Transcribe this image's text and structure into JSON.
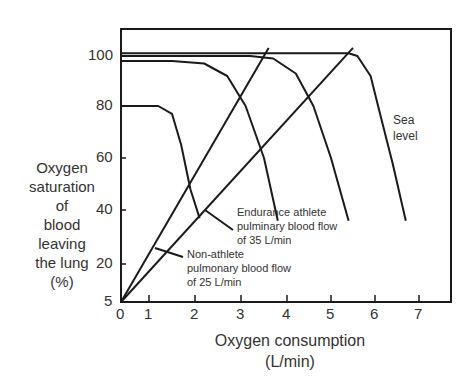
{
  "chart_data": {
    "type": "line",
    "title": "",
    "xlabel": "Oxygen consumption (L/min)",
    "xlabel_lines": [
      "Oxygen consumption",
      "(L/min)"
    ],
    "ylabel": "Oxygen saturation of blood leaving the lung (%)",
    "ylabel_lines": [
      "Oxygen",
      "saturation",
      "of",
      "blood",
      "leaving",
      "the lung",
      "(%)"
    ],
    "x_ticks": [
      "0",
      "1",
      "2",
      "3",
      "4",
      "5",
      "6",
      "7"
    ],
    "y_ticks": [
      "5",
      "20",
      "40",
      "60",
      "80",
      "100"
    ],
    "xlim": [
      0,
      7.7
    ],
    "ylim": [
      5,
      110
    ],
    "grid": false,
    "legend": "none",
    "series": [
      {
        "name": "Non-athlete pulmonary blood flow of 25 L/min",
        "kind": "straight",
        "x": [
          0,
          3.6
        ],
        "y": [
          5,
          103
        ]
      },
      {
        "name": "Endurance athlete pulmonary blood flow of 35 L/min",
        "kind": "straight",
        "x": [
          0,
          5.5
        ],
        "y": [
          5,
          103
        ]
      },
      {
        "name": "Altitude curve (80%)",
        "kind": "saturation",
        "x": [
          0,
          1.2,
          1.5,
          1.7,
          1.9,
          2.1
        ],
        "y": [
          80,
          80,
          77,
          65,
          48,
          37
        ]
      },
      {
        "name": "Curve (~98%)",
        "kind": "saturation",
        "x": [
          0,
          1.5,
          2.2,
          2.7,
          3.1,
          3.5,
          3.8
        ],
        "y": [
          98,
          98,
          97,
          92,
          80,
          60,
          36
        ]
      },
      {
        "name": "Curve (~100%)",
        "kind": "saturation",
        "x": [
          0,
          3.2,
          3.7,
          4.2,
          4.6,
          5.0,
          5.4
        ],
        "y": [
          100,
          100,
          99,
          93,
          80,
          60,
          36
        ]
      },
      {
        "name": "Sea level",
        "kind": "saturation",
        "x": [
          0,
          5.4,
          5.6,
          5.9,
          6.1,
          6.4,
          6.7
        ],
        "y": [
          101,
          101,
          100,
          92,
          78,
          58,
          36
        ]
      }
    ],
    "annotations": [
      {
        "text": "Sea level",
        "lines": [
          "Sea",
          "level"
        ]
      },
      {
        "text": "Endurance athlete pulmonary blood flow of 35 L/min",
        "lines": [
          "Endurance athlete",
          "pulminary blood flow",
          "of 35 L/min"
        ]
      },
      {
        "text": "Non-athlete pulmonary blood flow of 25 L/min",
        "lines": [
          "Non-athlete",
          "pulmonary blood flow",
          "of 25 L/min"
        ]
      }
    ]
  }
}
